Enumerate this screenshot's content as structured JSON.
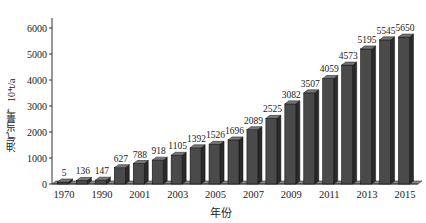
{
  "chart_data": {
    "type": "bar",
    "title": "",
    "xlabel": "年份",
    "ylabel": "油气当量，10⁴t/a",
    "ylim": [
      0,
      6000
    ],
    "yticks": [
      0,
      1000,
      2000,
      3000,
      4000,
      5000,
      6000
    ],
    "grid": false,
    "legend": null,
    "style": "3d-column",
    "bar_color": "#4a4a4a",
    "tick_labels_shown": [
      "1970",
      "1990",
      "2001",
      "2003",
      "2005",
      "2007",
      "2009",
      "2011",
      "2013",
      "2015"
    ],
    "values": [
      5,
      136,
      147,
      627,
      788,
      918,
      1105,
      1392,
      1526,
      1696,
      2089,
      2525,
      3082,
      3507,
      4059,
      4573,
      5195,
      5545,
      5650
    ],
    "data_labels": [
      "5",
      "136",
      "147",
      "627",
      "788",
      "918",
      "1105",
      "1392",
      "1526",
      "1696",
      "2089",
      "2525",
      "3082",
      "3507",
      "4059",
      "4573",
      "5195",
      "5545",
      "5650"
    ]
  },
  "labels": {
    "x_axis_title": "年份",
    "y_axis_title": "油气当量，10⁴t/a"
  }
}
